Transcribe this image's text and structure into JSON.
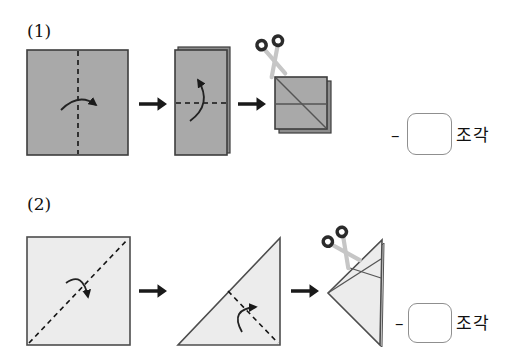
{
  "page": {
    "background": "#ffffff"
  },
  "problems": [
    {
      "number": "(1)",
      "dash": "–",
      "answer_value": "",
      "unit": "조각",
      "steps": [
        "square-with-vertical-fold-line",
        "half-folded-rectangle",
        "cut-square-with-scissors"
      ]
    },
    {
      "number": "(2)",
      "dash": "–",
      "answer_value": "",
      "unit": "조각",
      "steps": [
        "square-with-diagonal-fold-line",
        "folded-triangle",
        "cut-narrow-triangle-with-scissors"
      ]
    }
  ],
  "icons": {
    "scissors": "scissors-icon",
    "step_arrow": "right-arrow-icon",
    "fold_arrow": "curved-fold-arrow-icon"
  },
  "colors": {
    "paper_dark": "#a9a9a9",
    "paper_dark_back": "#8d8d8d",
    "paper_light": "#ececec",
    "paper_light_back": "#dfdfdf",
    "paper_outline": "#3d3d3d",
    "fold_dash_line": "#141414",
    "cut_line": "#555555",
    "arrow": "#1a1a1a",
    "scissors_handles": "#2b2b2b",
    "scissors_blades": "#c6c6c6",
    "answer_box_border": "#8f8f8f",
    "text": "#111111"
  }
}
